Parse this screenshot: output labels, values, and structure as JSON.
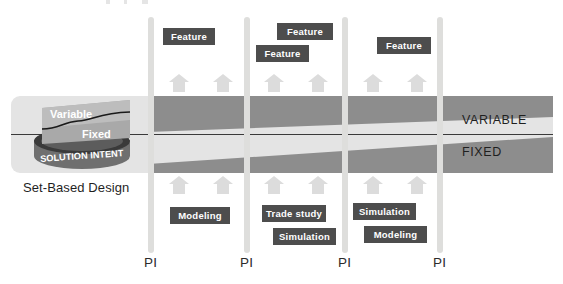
{
  "diagram": {
    "title": "Set-Based Design",
    "solution_intent": {
      "cylinder_label": "SOLUTION INTENT",
      "upper_label": "Variable",
      "lower_label": "Fixed",
      "caption": "Set-Based Design"
    },
    "band": {
      "variable_label": "VARIABLE",
      "fixed_label": "FIXED",
      "background_color": "#e4e4e4",
      "wedge_color": "#8d8d8d",
      "divider_color": "#3a3a3a"
    },
    "timeline": {
      "marker_label": "PI",
      "markers": [
        {
          "label": "PI"
        },
        {
          "label": "PI"
        },
        {
          "label": "PI"
        },
        {
          "label": "PI"
        }
      ],
      "bar_color": "#dededc"
    },
    "chip_color": "#4d4d4d",
    "arrow_color": "#dcdcdc",
    "features_top": [
      {
        "label": "Feature"
      },
      {
        "label": "Feature"
      },
      {
        "label": "Feature"
      },
      {
        "label": "Feature"
      }
    ],
    "activities_bottom": [
      {
        "label": "Modeling"
      },
      {
        "label": "Trade study"
      },
      {
        "label": "Simulation"
      },
      {
        "label": "Simulation"
      },
      {
        "label": "Modeling"
      }
    ],
    "arrows_top": [
      {
        "name": "arrow-up-1"
      },
      {
        "name": "arrow-up-2"
      },
      {
        "name": "arrow-up-3"
      },
      {
        "name": "arrow-up-4"
      },
      {
        "name": "arrow-up-5"
      },
      {
        "name": "arrow-up-6"
      }
    ],
    "arrows_bottom": [
      {
        "name": "arrow-up-7"
      },
      {
        "name": "arrow-up-8"
      },
      {
        "name": "arrow-up-9"
      },
      {
        "name": "arrow-up-10"
      },
      {
        "name": "arrow-up-11"
      },
      {
        "name": "arrow-up-12"
      }
    ]
  }
}
